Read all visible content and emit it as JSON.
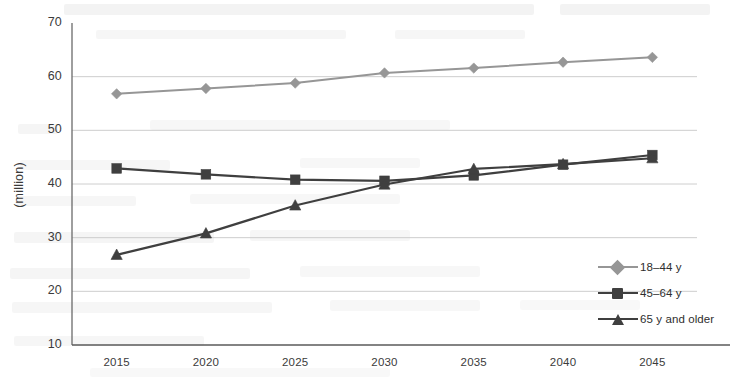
{
  "chart_data": {
    "type": "line",
    "title": "",
    "xlabel": "",
    "ylabel": "(million)",
    "categories": [
      "2015",
      "2020",
      "2025",
      "2030",
      "2035",
      "2040",
      "2045"
    ],
    "x": [
      2015,
      2020,
      2025,
      2030,
      2035,
      2040,
      2045
    ],
    "ylim": [
      10,
      70
    ],
    "ytick_values": [
      10,
      20,
      30,
      40,
      50,
      60,
      70
    ],
    "ytick_labels": [
      "10",
      "20",
      "30",
      "40",
      "50",
      "60",
      "70"
    ],
    "grid": true,
    "grid_axis": "y",
    "legend_position": "inner-right",
    "series": [
      {
        "name": "18–44 y",
        "marker": "diamond",
        "color": "#969696",
        "values": [
          56.8,
          57.8,
          58.8,
          60.7,
          61.6,
          62.7,
          63.6
        ]
      },
      {
        "name": "45–64 y",
        "marker": "square",
        "color": "#3f3f3f",
        "values": [
          42.9,
          41.8,
          40.8,
          40.6,
          41.6,
          43.6,
          45.4
        ]
      },
      {
        "name": "65 y and older",
        "marker": "triangle",
        "color": "#3f3f3f",
        "values": [
          26.8,
          30.8,
          36.0,
          39.9,
          42.8,
          43.7,
          44.8
        ]
      }
    ]
  },
  "axis": {
    "y_title": "(million)"
  },
  "legend": {
    "items": [
      {
        "label": "18–44 y"
      },
      {
        "label": "45–64 y"
      },
      {
        "label": "65 y and older"
      }
    ]
  },
  "colors": {
    "series_1": "#969696",
    "series_2": "#3f3f3f",
    "series_3": "#3f3f3f",
    "grid": "#c8c8c8",
    "axis": "#5a5a5a",
    "text": "#3b3b3b"
  }
}
